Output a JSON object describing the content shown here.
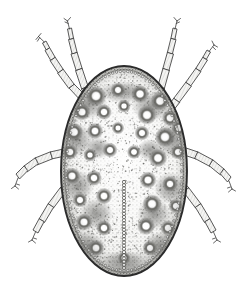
{
  "figure": {
    "domain": "Natural-Image",
    "medium": "stippled pen-and-ink scientific engraving",
    "canvas": {
      "width": 249,
      "height": 293
    },
    "background_color": "#ffffff"
  },
  "palette": {
    "background": "#ffffff",
    "paper_tint": "#fbfbfb",
    "outline_dark": "#2b2b2b",
    "body_rim": "#4a4a4a",
    "body_fill_light": "#f2f2f0",
    "body_fill_mid": "#d8d8d4",
    "body_shade": "#9a9a96",
    "spot_dark": "#6d6d69",
    "spot_core": "#ffffff",
    "stipple": "#5a5a57",
    "leg_fill": "#f4f4f2",
    "leg_line": "#3c3c3c",
    "midline": "#555553"
  },
  "subject": {
    "common_name": "mite",
    "view": "dorsal",
    "body": {
      "name": "idiosoma",
      "shape": "ovoid",
      "center_x": 124,
      "center_y": 171,
      "radius_x": 63,
      "radius_y": 105,
      "rim_thickness": 4,
      "marginal_bead_count": 96,
      "texture": "dense stipple with scattered ringed pore-spots"
    },
    "midline_groove": {
      "name": "median sejugal groove",
      "x": 124,
      "y_start": 182,
      "y_end": 268,
      "bead_count": 28,
      "bead_radius": 1.6
    },
    "pore_spots": [
      {
        "cx": 96,
        "cy": 96,
        "r": 5.5
      },
      {
        "cx": 118,
        "cy": 90,
        "r": 4.0
      },
      {
        "cx": 140,
        "cy": 94,
        "r": 4.8
      },
      {
        "cx": 160,
        "cy": 101,
        "r": 5.0
      },
      {
        "cx": 82,
        "cy": 112,
        "r": 4.6
      },
      {
        "cx": 104,
        "cy": 112,
        "r": 4.2
      },
      {
        "cx": 124,
        "cy": 106,
        "r": 3.6
      },
      {
        "cx": 147,
        "cy": 115,
        "r": 5.2
      },
      {
        "cx": 170,
        "cy": 118,
        "r": 4.4
      },
      {
        "cx": 74,
        "cy": 132,
        "r": 5.0
      },
      {
        "cx": 95,
        "cy": 131,
        "r": 4.4
      },
      {
        "cx": 118,
        "cy": 128,
        "r": 3.4
      },
      {
        "cx": 142,
        "cy": 133,
        "r": 4.0
      },
      {
        "cx": 165,
        "cy": 137,
        "r": 5.4
      },
      {
        "cx": 179,
        "cy": 128,
        "r": 4.2
      },
      {
        "cx": 70,
        "cy": 152,
        "r": 4.2
      },
      {
        "cx": 90,
        "cy": 155,
        "r": 3.6
      },
      {
        "cx": 110,
        "cy": 150,
        "r": 4.0
      },
      {
        "cx": 134,
        "cy": 152,
        "r": 3.8
      },
      {
        "cx": 158,
        "cy": 158,
        "r": 5.0
      },
      {
        "cx": 178,
        "cy": 152,
        "r": 4.0
      },
      {
        "cx": 72,
        "cy": 176,
        "r": 4.6
      },
      {
        "cx": 94,
        "cy": 178,
        "r": 4.2
      },
      {
        "cx": 104,
        "cy": 196,
        "r": 4.4
      },
      {
        "cx": 148,
        "cy": 180,
        "r": 4.6
      },
      {
        "cx": 170,
        "cy": 184,
        "r": 4.2
      },
      {
        "cx": 80,
        "cy": 200,
        "r": 4.0
      },
      {
        "cx": 152,
        "cy": 204,
        "r": 5.2
      },
      {
        "cx": 176,
        "cy": 206,
        "r": 4.0
      },
      {
        "cx": 84,
        "cy": 222,
        "r": 4.6
      },
      {
        "cx": 104,
        "cy": 228,
        "r": 4.2
      },
      {
        "cx": 146,
        "cy": 226,
        "r": 4.8
      },
      {
        "cx": 168,
        "cy": 228,
        "r": 4.2
      },
      {
        "cx": 96,
        "cy": 248,
        "r": 4.4
      },
      {
        "cx": 150,
        "cy": 248,
        "r": 4.0
      },
      {
        "cx": 124,
        "cy": 258,
        "r": 3.4
      }
    ],
    "legs": [
      {
        "id": "leg-1-left",
        "label": "left leg I",
        "side": "left",
        "pair": 1,
        "segments": 5,
        "attach": {
          "x": 88,
          "y": 96
        },
        "tip": {
          "x": 46,
          "y": 30
        },
        "claw": "forked"
      },
      {
        "id": "leg-2-left",
        "label": "left leg II",
        "side": "left",
        "pair": 2,
        "segments": 5,
        "attach": {
          "x": 80,
          "y": 110
        },
        "tip": {
          "x": 70,
          "y": 22
        },
        "claw": "forked"
      },
      {
        "id": "leg-3-left",
        "label": "left leg III",
        "side": "left",
        "pair": 3,
        "segments": 5,
        "attach": {
          "x": 66,
          "y": 152
        },
        "tip": {
          "x": 17,
          "y": 192
        },
        "claw": "forked"
      },
      {
        "id": "leg-4-left",
        "label": "left leg IV",
        "side": "left",
        "pair": 4,
        "segments": 5,
        "attach": {
          "x": 68,
          "y": 182
        },
        "tip": {
          "x": 34,
          "y": 240
        },
        "claw": "forked"
      },
      {
        "id": "leg-1-right",
        "label": "right leg I",
        "side": "right",
        "pair": 1,
        "segments": 5,
        "attach": {
          "x": 160,
          "y": 96
        },
        "tip": {
          "x": 178,
          "y": 22
        },
        "claw": "forked"
      },
      {
        "id": "leg-2-right",
        "label": "right leg II",
        "side": "right",
        "pair": 2,
        "segments": 5,
        "attach": {
          "x": 170,
          "y": 112
        },
        "tip": {
          "x": 206,
          "y": 44
        },
        "claw": "forked"
      },
      {
        "id": "leg-3-right",
        "label": "right leg III",
        "side": "right",
        "pair": 3,
        "segments": 5,
        "attach": {
          "x": 182,
          "y": 150
        },
        "tip": {
          "x": 232,
          "y": 190
        },
        "claw": "forked"
      },
      {
        "id": "leg-4-right",
        "label": "right leg IV",
        "side": "right",
        "pair": 4,
        "segments": 5,
        "attach": {
          "x": 180,
          "y": 180
        },
        "tip": {
          "x": 214,
          "y": 240
        },
        "claw": "forked"
      }
    ]
  },
  "captions": {
    "alt_text": "Black and white stippled scientific illustration of a mite seen from above, with an oval mottled body and four pairs of segmented legs.",
    "visible_labels": []
  }
}
